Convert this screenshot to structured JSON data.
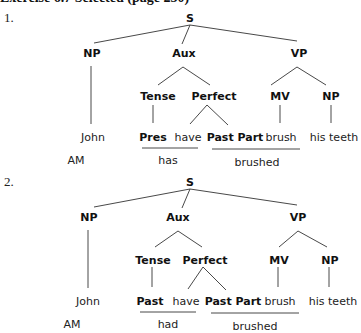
{
  "header": {
    "title": "Exercise 6.7 Selected (page 230)"
  },
  "trees": [
    {
      "number": "1.",
      "root": "S",
      "np": "NP",
      "aux": "Aux",
      "vp": "VP",
      "tense": "Tense",
      "perfect": "Perfect",
      "mv": "MV",
      "np2": "NP",
      "subject": "John",
      "tense_value": "Pres",
      "have": "have",
      "past_part": "Past Part",
      "verb": "brush",
      "object": "his teeth",
      "am_label": "AM",
      "surface_aux": "has",
      "surface_verb": "brushed"
    },
    {
      "number": "2.",
      "root": "S",
      "np": "NP",
      "aux": "Aux",
      "vp": "VP",
      "tense": "Tense",
      "perfect": "Perfect",
      "mv": "MV",
      "np2": "NP",
      "subject": "John",
      "tense_value": "Past",
      "have": "have",
      "past_part": "Past Part",
      "verb": "brush",
      "object": "his teeth",
      "am_label": "AM",
      "surface_aux": "had",
      "surface_verb": "brushed"
    }
  ]
}
